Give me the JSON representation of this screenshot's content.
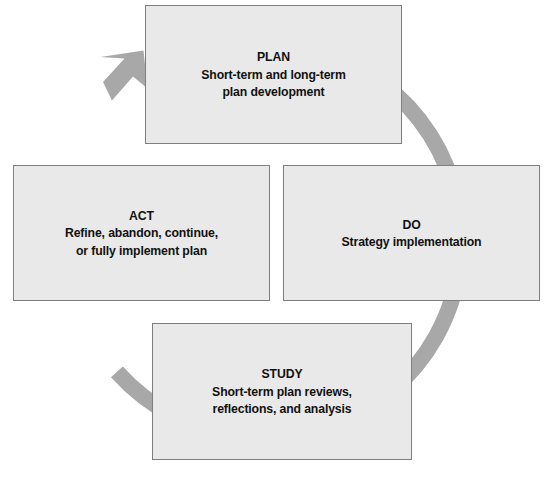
{
  "diagram": {
    "name": "PDCA improvement cycle",
    "direction": "clockwise",
    "colors": {
      "box_fill": "#e9e9e9",
      "box_border": "#7e7e7e",
      "arrow": "#a8a8a8",
      "text": "#111111",
      "background": "#ffffff"
    },
    "nodes": [
      {
        "id": "plan",
        "title": "PLAN",
        "description": "Short-term and long-term\nplan development",
        "position": "top"
      },
      {
        "id": "do",
        "title": "DO",
        "description": "Strategy implementation",
        "position": "right"
      },
      {
        "id": "study",
        "title": "STUDY",
        "description": "Short-term plan reviews,\nreflections, and analysis",
        "position": "bottom"
      },
      {
        "id": "act",
        "title": "ACT",
        "description": "Refine, abandon, continue,\nor fully implement plan",
        "position": "left"
      }
    ],
    "arrow": {
      "shape": "circular-arc",
      "head_label": "arrowhead pointing toward PLAN",
      "center_x": 278,
      "center_y": 232,
      "radius": 197,
      "thickness": 16
    }
  }
}
